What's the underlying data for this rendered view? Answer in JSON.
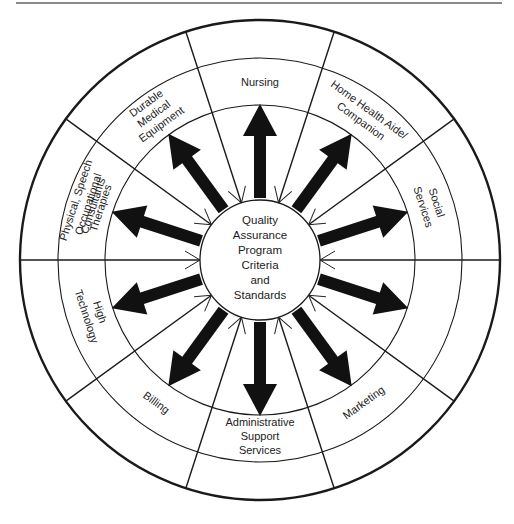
{
  "diagram": {
    "center": {
      "lines": [
        "Quality",
        "Assurance",
        "Program",
        "Criteria",
        "and",
        "Standards"
      ]
    },
    "sectors": [
      {
        "id": "nursing",
        "lines": [
          "Nursing"
        ]
      },
      {
        "id": "home-health",
        "lines": [
          "Home Health Aide/",
          "Companion"
        ]
      },
      {
        "id": "social-services",
        "lines": [
          "Social",
          "Services"
        ]
      },
      {
        "id": "consultants",
        "lines": [
          "Consultants"
        ]
      },
      {
        "id": "marketing",
        "lines": [
          "Marketing"
        ]
      },
      {
        "id": "admin-support",
        "lines": [
          "Administrative",
          "Support",
          "Services"
        ]
      },
      {
        "id": "billing",
        "lines": [
          "Billing"
        ]
      },
      {
        "id": "high-technology",
        "lines": [
          "High",
          "Technology"
        ]
      },
      {
        "id": "therapies",
        "lines": [
          "Physical, Speech",
          "Occupational",
          "Therapies"
        ]
      },
      {
        "id": "dme",
        "lines": [
          "Durable",
          "Medical",
          "Equipment"
        ]
      }
    ],
    "colors": {
      "line": "#1a1a1a",
      "arrow": "#111111",
      "background": "#ffffff"
    }
  }
}
